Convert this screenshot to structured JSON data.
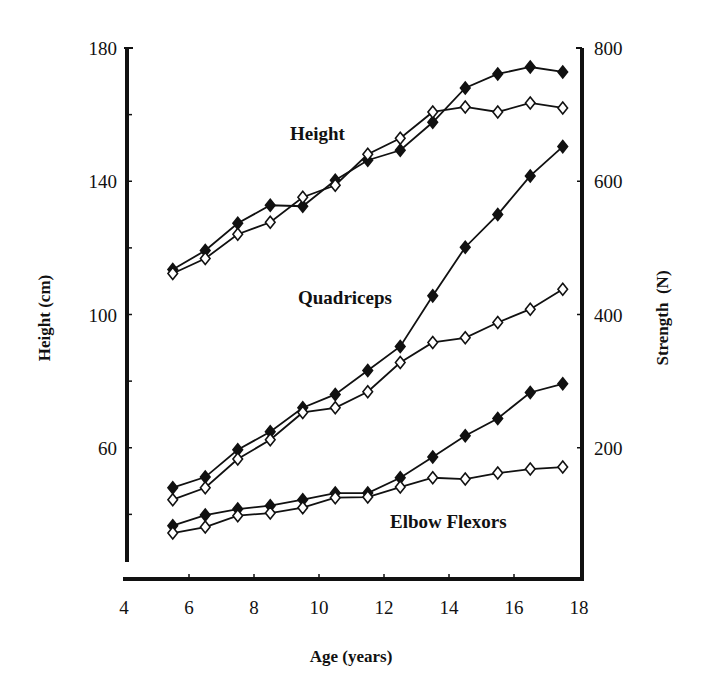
{
  "chart_data": {
    "type": "line",
    "title": "",
    "xlabel": "Age (years)",
    "ylabel": "Height (cm)",
    "ylabel_right": "Strength  (N)",
    "xlim": [
      4,
      18
    ],
    "ylim": [
      20,
      180
    ],
    "ylim_right": [
      0,
      800
    ],
    "x_ticks": [
      4,
      6,
      8,
      10,
      12,
      14,
      16,
      18
    ],
    "y_ticks": [
      60,
      100,
      140,
      180
    ],
    "y_ticks_right": [
      200,
      400,
      600,
      800
    ],
    "grid": false,
    "legend": "none (inline series labels)",
    "marker_legend": {
      "filled_diamond": "group A (solid markers)",
      "open_diamond": "group B (open markers)"
    },
    "x": [
      5.5,
      6.5,
      7.5,
      8.5,
      9.5,
      10.5,
      11.5,
      12.5,
      13.5,
      14.5,
      15.5,
      16.5,
      17.5
    ],
    "series": [
      {
        "name": "Height (filled)",
        "group": "Height",
        "axis": "left",
        "marker": "filled",
        "values": [
          113.5,
          119.2,
          127.4,
          132.8,
          132.5,
          140.3,
          146.3,
          149.3,
          157.7,
          168.0,
          172.2,
          174.3,
          172.8
        ]
      },
      {
        "name": "Height (open)",
        "group": "Height",
        "axis": "left",
        "marker": "open",
        "values": [
          112.3,
          116.8,
          124.1,
          127.7,
          135.2,
          138.8,
          148.1,
          152.9,
          160.8,
          162.3,
          160.8,
          163.5,
          162.0
        ]
      },
      {
        "name": "Quadriceps (filled)",
        "group": "Quadriceps",
        "axis": "right",
        "marker": "filled",
        "values": [
          140,
          156,
          197,
          224,
          260,
          280,
          316,
          352,
          428,
          501,
          550,
          608,
          652
        ]
      },
      {
        "name": "Quadriceps (open)",
        "group": "Quadriceps",
        "axis": "right",
        "marker": "open",
        "values": [
          122,
          140,
          183,
          212,
          253,
          260,
          284,
          328,
          358,
          365,
          388,
          408,
          438
        ]
      },
      {
        "name": "Elbow Flexors (filled)",
        "group": "Elbow Flexors",
        "axis": "right",
        "marker": "filled",
        "values": [
          83,
          99,
          108,
          113,
          122,
          132,
          132,
          155,
          186,
          218,
          244,
          283,
          296
        ]
      },
      {
        "name": "Elbow Flexors (open)",
        "group": "Elbow Flexors",
        "axis": "right",
        "marker": "open",
        "values": [
          72,
          81,
          98,
          102,
          110,
          125,
          126,
          141,
          155,
          153,
          162,
          168,
          171
        ]
      }
    ],
    "annotations": [
      {
        "text": "Height",
        "x": 290,
        "y": 140
      },
      {
        "text": "Quadriceps",
        "x": 298,
        "y": 304
      },
      {
        "text": "Elbow Flexors",
        "x": 390,
        "y": 528
      }
    ]
  },
  "labels": {
    "xlabel": "Age (years)",
    "ylabel": "Height (cm)",
    "ylabel_right": "Strength  (N)",
    "series_height": "Height",
    "series_quadriceps": "Quadriceps",
    "series_elbow": "Elbow Flexors"
  }
}
